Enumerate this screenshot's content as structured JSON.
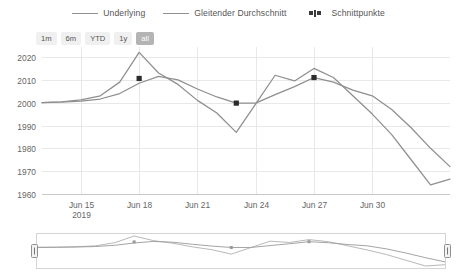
{
  "legend": {
    "items": [
      {
        "label": "Underlying",
        "icon": "line-swatch",
        "type": "line"
      },
      {
        "label": "Gleitender Durchschnitt",
        "icon": "line-swatch",
        "type": "line"
      },
      {
        "label": "Schnittpunkte",
        "icon": "points-swatch",
        "type": "points"
      }
    ]
  },
  "range_selector": {
    "buttons": [
      {
        "label": "1m",
        "selected": false
      },
      {
        "label": "6m",
        "selected": false
      },
      {
        "label": "YTD",
        "selected": false
      },
      {
        "label": "1y",
        "selected": false
      },
      {
        "label": "all",
        "selected": true
      }
    ]
  },
  "axes": {
    "y_ticks": [
      "2020",
      "2010",
      "2000",
      "1990",
      "1980",
      "1970",
      "1960"
    ],
    "x_ticks": [
      "Jun 15",
      "Jun 18",
      "Jun 21",
      "Jun 24",
      "Jun 27",
      "Jun 30"
    ],
    "x_year": "2019"
  },
  "chart_data": {
    "type": "line",
    "title": "",
    "xlabel": "",
    "ylabel": "",
    "ylim": [
      1960,
      2020
    ],
    "grid": true,
    "legend_position": "top-center",
    "x": [
      "Jun 13",
      "Jun 14",
      "Jun 15",
      "Jun 16",
      "Jun 17",
      "Jun 18",
      "Jun 19",
      "Jun 20",
      "Jun 21",
      "Jun 22",
      "Jun 23",
      "Jun 24",
      "Jun 25",
      "Jun 26",
      "Jun 27",
      "Jun 28",
      "Jun 29",
      "Jun 30",
      "Jul 01",
      "Jul 02",
      "Jul 03",
      "Jul 04"
    ],
    "x_tick_labels": [
      "Jun 15",
      "Jun 18",
      "Jun 21",
      "Jun 24",
      "Jun 27",
      "Jun 30"
    ],
    "series": [
      {
        "name": "Underlying",
        "values": [
          2000.0,
          2000.4,
          2001.2,
          2003.0,
          2009.0,
          2022.0,
          2013.0,
          2008.0,
          2001.0,
          1995.5,
          1987.0,
          1999.5,
          2012.0,
          2009.5,
          2015.0,
          2011.0,
          2003.0,
          1995.0,
          1986.0,
          1975.0,
          1964.0,
          1966.5
        ]
      },
      {
        "name": "Gleitender Durchschnitt",
        "values": [
          2000.0,
          2000.2,
          2000.7,
          2001.6,
          2004.0,
          2008.5,
          2011.5,
          2010.0,
          2006.0,
          2002.5,
          1999.8,
          1999.8,
          2003.5,
          2007.0,
          2011.0,
          2009.0,
          2005.5,
          2003.0,
          1997.0,
          1989.0,
          1980.0,
          1972.0
        ]
      }
    ],
    "intersections": [
      {
        "x": "Jun 18",
        "y": 2010.6,
        "label": "Schnittpunkt 1"
      },
      {
        "x": "Jun 23",
        "y": 1999.8,
        "label": "Schnittpunkt 2"
      },
      {
        "x": "Jun 27",
        "y": 2011.0,
        "label": "Schnittpunkt 3"
      }
    ]
  },
  "navigator": {
    "left_handle": "navigator-left-handle",
    "right_handle": "navigator-right-handle",
    "selected_range": "all"
  }
}
